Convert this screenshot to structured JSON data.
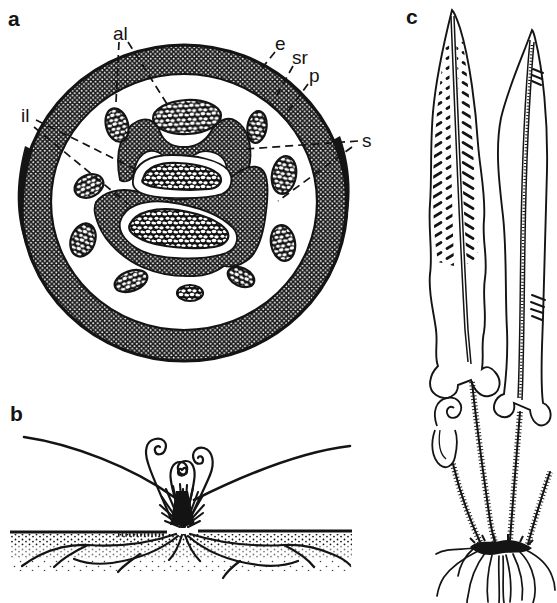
{
  "colors": {
    "paper": "#ffffff",
    "ink": "#141414"
  },
  "panel_a": {
    "letter": "a",
    "labels": {
      "al": "al",
      "e": "e",
      "sr": "sr",
      "p": "p",
      "il": "il",
      "s": "s"
    }
  },
  "panel_b": {
    "letter": "b"
  },
  "panel_c": {
    "letter": "c"
  }
}
